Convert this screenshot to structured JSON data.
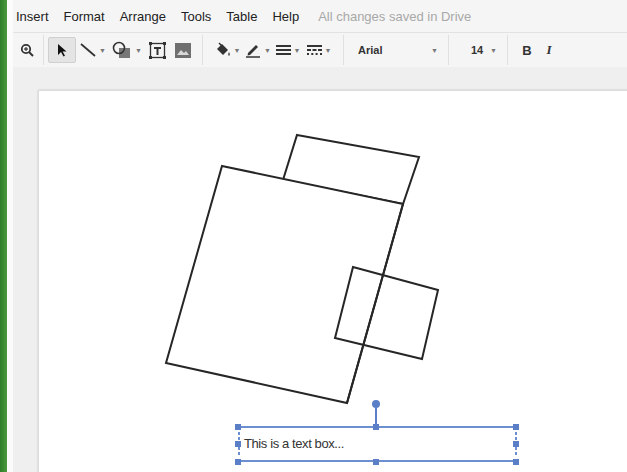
{
  "menubar": {
    "items": [
      "Insert",
      "Format",
      "Arrange",
      "Tools",
      "Table",
      "Help"
    ],
    "save_status": "All changes saved in Drive"
  },
  "toolbar": {
    "tools": [
      {
        "name": "zoom",
        "icon": "zoom-icon"
      },
      {
        "name": "select",
        "icon": "arrow-pointer-icon",
        "active": true
      },
      {
        "name": "line",
        "icon": "line-icon",
        "dropdown": true
      },
      {
        "name": "shape",
        "icon": "shape-icon",
        "dropdown": true
      },
      {
        "name": "text-box",
        "icon": "text-box-icon"
      },
      {
        "name": "image",
        "icon": "image-icon"
      },
      {
        "name": "fill-color",
        "icon": "paint-bucket-icon",
        "dropdown": true
      },
      {
        "name": "line-color",
        "icon": "pencil-icon",
        "dropdown": true
      },
      {
        "name": "line-weight",
        "icon": "line-weight-icon",
        "dropdown": true
      },
      {
        "name": "line-dash",
        "icon": "line-dash-icon",
        "dropdown": true
      }
    ],
    "font_family": "Arial",
    "font_size": "14",
    "bold_label": "B",
    "italic_label": "I"
  },
  "canvas": {
    "textbox_text": "This is a text box...",
    "selection_color": "#5b7fc7",
    "stroke_color": "#222222"
  }
}
